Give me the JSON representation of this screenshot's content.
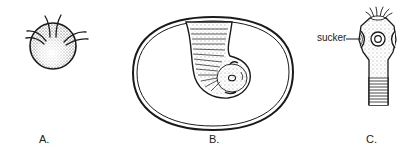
{
  "figure": {
    "panels": [
      {
        "id": "A",
        "label": "A.",
        "subject": "hooked embryo (oncosphere) with hooklets"
      },
      {
        "id": "B",
        "label": "B.",
        "subject": "cysticercus (bladder worm) with invaginated scolex"
      },
      {
        "id": "C",
        "label": "C.",
        "subject": "scolex with suckers and hooks"
      }
    ],
    "annotations": [
      {
        "panel": "C",
        "text": "sucker",
        "points_to": "lateral sucker of scolex"
      }
    ],
    "colors": {
      "ink": "#1a1a1a",
      "background": "#ffffff"
    }
  }
}
